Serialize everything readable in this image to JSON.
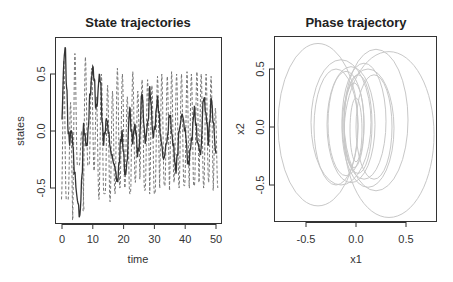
{
  "chart_data": [
    {
      "type": "line",
      "title": "State trajectories",
      "xlabel": "time",
      "ylabel": "states",
      "xlim": [
        -2,
        52
      ],
      "ylim": [
        -0.82,
        0.82
      ],
      "xticks": [
        0,
        10,
        20,
        30,
        40,
        50
      ],
      "xtick_labels": [
        "0",
        "10",
        "20",
        "30",
        "40",
        "50"
      ],
      "yticks": [
        -0.5,
        0.0,
        0.5
      ],
      "ytick_labels": [
        "-0.5",
        "0.0",
        "0.5"
      ],
      "grid": false,
      "legend": null,
      "series": [
        {
          "name": "x1",
          "style": "solid",
          "color": "#333333",
          "x": [
            0,
            0.5,
            1,
            1.5,
            2,
            2.5,
            3,
            3.5,
            4,
            5,
            5.8,
            6.5,
            7,
            7.5,
            8,
            8.5,
            9,
            10,
            10.5,
            11,
            11.5,
            12,
            12.5,
            13,
            13.5,
            14,
            14.5,
            15,
            16,
            17,
            18,
            18.5,
            19,
            19.5,
            20,
            20.5,
            21,
            22,
            22.5,
            23,
            23.5,
            24,
            24.5,
            25,
            26,
            26.5,
            27,
            28,
            28.5,
            29,
            29.5,
            30,
            31,
            31.5,
            32,
            33,
            34,
            35,
            36,
            37,
            37.5,
            38,
            39,
            40,
            41,
            42,
            43,
            43.5,
            44,
            45,
            46,
            47,
            47.5,
            48,
            48.5,
            49,
            50
          ],
          "values": [
            0.1,
            0.55,
            0.75,
            0.4,
            0.0,
            -0.1,
            0.02,
            -0.1,
            -0.35,
            -0.6,
            -0.75,
            -0.4,
            0.05,
            -0.05,
            -0.15,
            0.0,
            0.3,
            0.55,
            0.45,
            0.2,
            0.25,
            0.48,
            0.45,
            0.1,
            -0.1,
            0.0,
            0.12,
            0.0,
            -0.2,
            -0.3,
            -0.45,
            -0.3,
            -0.1,
            -0.02,
            -0.2,
            -0.4,
            -0.3,
            0.2,
            0.0,
            -0.1,
            0.05,
            0.0,
            -0.2,
            -0.15,
            0.35,
            0.1,
            -0.1,
            0.1,
            0.38,
            0.2,
            -0.05,
            0.0,
            0.28,
            0.15,
            -0.05,
            -0.25,
            -0.1,
            0.15,
            -0.1,
            -0.35,
            -0.2,
            0.0,
            0.15,
            0.0,
            -0.3,
            -0.1,
            0.2,
            0.05,
            -0.1,
            -0.2,
            0.3,
            0.1,
            -0.1,
            0.1,
            0.3,
            0.1,
            -0.2
          ]
        },
        {
          "name": "x2",
          "style": "dashed",
          "color": "#777777",
          "period": 1.55,
          "x_peaks": [
            0.6,
            2.8,
            4.2,
            6.4,
            7.6,
            9.6,
            11.2,
            12.8,
            14.8,
            16.4,
            18.0,
            19.6,
            21.2,
            23.0,
            24.6,
            26.0,
            27.8,
            29.2,
            31.0,
            32.4,
            34.2,
            35.6,
            37.2,
            38.8,
            40.6,
            42.0,
            43.8,
            45.2,
            46.8,
            48.4,
            49.8
          ],
          "values_peaks": [
            0.62,
            0.25,
            0.68,
            0.0,
            0.65,
            0.55,
            0.3,
            0.5,
            0.4,
            0.35,
            0.55,
            0.5,
            0.3,
            0.52,
            0.35,
            0.45,
            0.45,
            0.4,
            0.48,
            0.5,
            0.48,
            0.52,
            0.5,
            0.5,
            0.52,
            0.5,
            0.52,
            0.5,
            0.5,
            0.48,
            0.2
          ],
          "values_troughs": [
            -0.6,
            -0.78,
            -0.3,
            -0.7,
            -0.3,
            -0.35,
            -0.6,
            -0.55,
            -0.62,
            -0.55,
            -0.5,
            -0.5,
            -0.55,
            -0.45,
            -0.42,
            -0.52,
            -0.55,
            -0.55,
            -0.5,
            -0.48,
            -0.52,
            -0.45,
            -0.5,
            -0.48,
            -0.5,
            -0.48,
            -0.45,
            -0.5,
            -0.45,
            -0.52,
            -0.5
          ]
        }
      ]
    },
    {
      "type": "line",
      "title": "Phase trajectory",
      "xlabel": "x1",
      "ylabel": "x2",
      "xlim": [
        -0.82,
        0.81
      ],
      "ylim": [
        -0.82,
        0.78
      ],
      "xticks": [
        -0.5,
        0.0,
        0.5
      ],
      "xtick_labels": [
        "-0.5",
        "0.0",
        "0.5"
      ],
      "yticks": [
        -0.5,
        0.0,
        0.5
      ],
      "ytick_labels": [
        "-0.5",
        "0.0",
        "0.5"
      ],
      "grid": false,
      "legend": null,
      "series": [
        {
          "name": "phase (x1, x2)",
          "style": "solid",
          "color": "#c8c8c8",
          "loops": [
            {
              "cx": -0.38,
              "rx": 0.4,
              "top": 0.72,
              "bottom": -0.68
            },
            {
              "cx": 0.33,
              "rx": 0.45,
              "top": 0.65,
              "bottom": -0.78
            },
            {
              "cx": 0.2,
              "rx": 0.32,
              "top": 0.67,
              "bottom": -0.55
            },
            {
              "cx": -0.15,
              "rx": 0.3,
              "top": 0.58,
              "bottom": -0.5
            },
            {
              "cx": -0.05,
              "rx": 0.24,
              "top": 0.52,
              "bottom": -0.48
            },
            {
              "cx": 0.08,
              "rx": 0.22,
              "top": 0.55,
              "bottom": -0.45
            },
            {
              "cx": -0.1,
              "rx": 0.18,
              "top": 0.48,
              "bottom": -0.42
            },
            {
              "cx": 0.02,
              "rx": 0.14,
              "top": 0.45,
              "bottom": -0.4
            },
            {
              "cx": -0.02,
              "rx": 0.1,
              "top": 0.38,
              "bottom": -0.35
            },
            {
              "cx": 0.0,
              "rx": 0.06,
              "top": 0.25,
              "bottom": -0.3
            },
            {
              "cx": 0.12,
              "rx": 0.26,
              "top": 0.5,
              "bottom": -0.52
            },
            {
              "cx": -0.2,
              "rx": 0.22,
              "top": 0.5,
              "bottom": -0.5
            },
            {
              "cx": 0.18,
              "rx": 0.18,
              "top": 0.45,
              "bottom": -0.45
            }
          ]
        }
      ]
    }
  ],
  "panels": {
    "left": {
      "title": "State trajectories",
      "xlabel": "time",
      "ylabel": "states"
    },
    "right": {
      "title": "Phase trajectory",
      "xlabel": "x1",
      "ylabel": "x2"
    }
  }
}
